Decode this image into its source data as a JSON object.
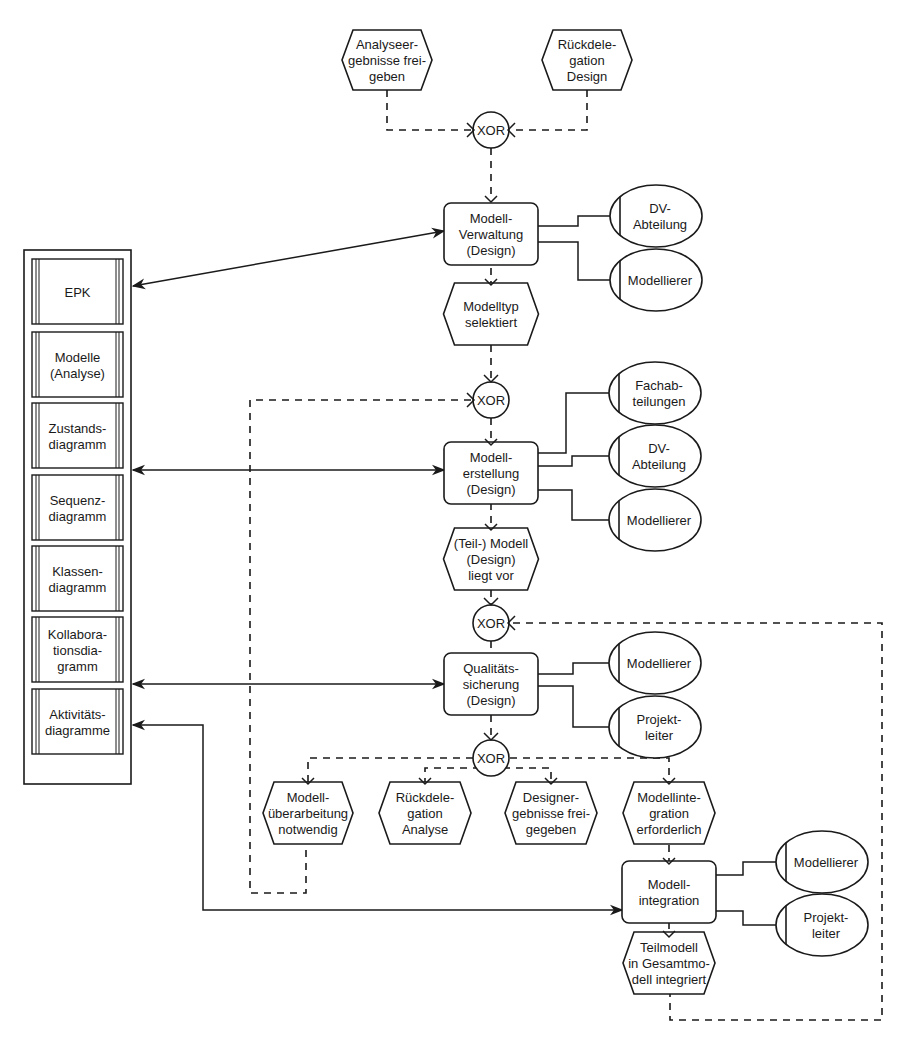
{
  "diagram": {
    "type": "EPK (event-driven process chain)",
    "events": {
      "e1": {
        "lines": [
          "Analyseer-",
          "gebnisse frei-",
          "geben"
        ]
      },
      "e2": {
        "lines": [
          "Rückdele-",
          "gation",
          "Design"
        ]
      },
      "e3": {
        "lines": [
          "Modelltyp",
          "selektiert"
        ]
      },
      "e4": {
        "lines": [
          "(Teil-) Modell",
          "(Design)",
          "liegt vor"
        ]
      },
      "e5": {
        "lines": [
          "Modell-",
          "überarbeitung",
          "notwendig"
        ]
      },
      "e6": {
        "lines": [
          "Rückdele-",
          "gation",
          "Analyse"
        ]
      },
      "e7": {
        "lines": [
          "Designer-",
          "gebnisse frei-",
          "gegeben"
        ]
      },
      "e8": {
        "lines": [
          "Modellinte-",
          "gration",
          "erforderlich"
        ]
      },
      "e9": {
        "lines": [
          "Teilmodell",
          "in Gesamtmo-",
          "dell integriert"
        ]
      }
    },
    "functions": {
      "f1": {
        "lines": [
          "Modell-",
          "Verwaltung",
          "(Design)"
        ]
      },
      "f2": {
        "lines": [
          "Modell-",
          "erstellung",
          "(Design)"
        ]
      },
      "f3": {
        "lines": [
          "Qualitäts-",
          "sicherung",
          "(Design)"
        ]
      },
      "f4": {
        "lines": [
          "Modell-",
          "integration"
        ]
      }
    },
    "org_units": {
      "o1": {
        "lines": [
          "DV-",
          "Abteilung"
        ]
      },
      "o2": {
        "lines": [
          "Modellierer"
        ]
      },
      "o3": {
        "lines": [
          "Fachab-",
          "teilungen"
        ]
      },
      "o4": {
        "lines": [
          "DV-",
          "Abteilung"
        ]
      },
      "o5": {
        "lines": [
          "Modellierer"
        ]
      },
      "o6": {
        "lines": [
          "Modellierer"
        ]
      },
      "o7": {
        "lines": [
          "Projekt-",
          "leiter"
        ]
      },
      "o8": {
        "lines": [
          "Modellierer"
        ]
      },
      "o9": {
        "lines": [
          "Projekt-",
          "leiter"
        ]
      }
    },
    "connectors": {
      "label": "XOR"
    },
    "documents": [
      {
        "lines": [
          "EPK"
        ]
      },
      {
        "lines": [
          "Modelle",
          "(Analyse)"
        ]
      },
      {
        "lines": [
          "Zustands-",
          "diagramm"
        ]
      },
      {
        "lines": [
          "Sequenz-",
          "diagramm"
        ]
      },
      {
        "lines": [
          "Klassen-",
          "diagramm"
        ]
      },
      {
        "lines": [
          "Kollabora-",
          "tionsdia-",
          "gramm"
        ]
      },
      {
        "lines": [
          "Aktivitäts-",
          "diagramme"
        ]
      }
    ]
  }
}
